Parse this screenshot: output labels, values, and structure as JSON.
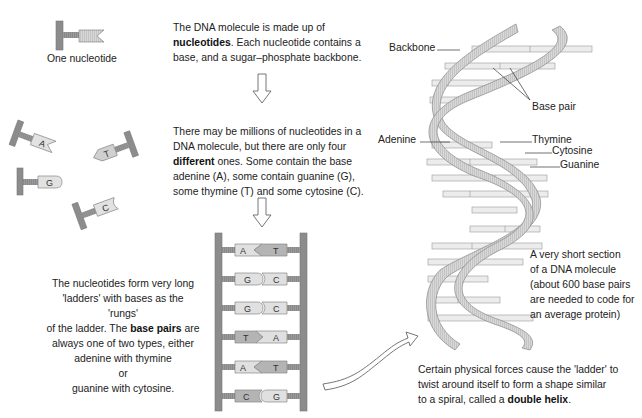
{
  "single_nucleotide": {
    "caption": "One nucleotide"
  },
  "intro": {
    "line1": "The DNA molecule is made up of",
    "bold": "nucleotides",
    "line2_rest": ". Each nucleotide contains a",
    "line3": "base, and a sugar–phosphate backbone."
  },
  "four_types": {
    "line1": "There may be millions of nucleotides in a",
    "line2": "DNA molecule, but there are only four",
    "bold": "different",
    "line3_rest": " ones. Some contain the base",
    "line4": "adenine (A), some contain guanine (G),",
    "line5": "some thymine (T) and some cytosine (C)."
  },
  "loose_nucleotides": [
    {
      "base": "A"
    },
    {
      "base": "T"
    },
    {
      "base": "G"
    },
    {
      "base": "C"
    }
  ],
  "ladder_text": {
    "line1": "The nucleotides form very long",
    "line2": "'ladders' with bases as the 'rungs'",
    "line3_pre": "of the ladder. The ",
    "bold": "base pairs",
    "line3_post": " are",
    "line4": "always one of two types, either",
    "line5": "adenine with thymine",
    "line6": "or",
    "line7": "guanine with cytosine."
  },
  "ladder_rungs": [
    {
      "left": "A",
      "right": "T"
    },
    {
      "left": "G",
      "right": "C"
    },
    {
      "left": "G",
      "right": "C"
    },
    {
      "left": "T",
      "right": "A"
    },
    {
      "left": "A",
      "right": "T"
    },
    {
      "left": "C",
      "right": "G"
    }
  ],
  "helix_labels": {
    "backbone": "Backbone",
    "base_pair": "Base pair",
    "adenine": "Adenine",
    "thymine": "Thymine",
    "cytosine": "Cytosine",
    "guanine": "Guanine"
  },
  "section_note": {
    "line1": "A very short section",
    "line2": "of a DNA molecule",
    "line3": "(about 600 base pairs",
    "line4": "are needed to code for",
    "line5": "an average protein)"
  },
  "helix_text": {
    "line1": "Certain physical forces cause the 'ladder' to",
    "line2": "twist around itself to form a shape similar",
    "line3_pre": "to a spiral, called a ",
    "bold": "double helix",
    "line3_post": "."
  },
  "colors": {
    "backbone": "#8c8c8c",
    "base_light": "#e0e0e0",
    "base_dark": "#b4b4b4",
    "ribbon": "#d4d4d4",
    "text": "#222222"
  }
}
